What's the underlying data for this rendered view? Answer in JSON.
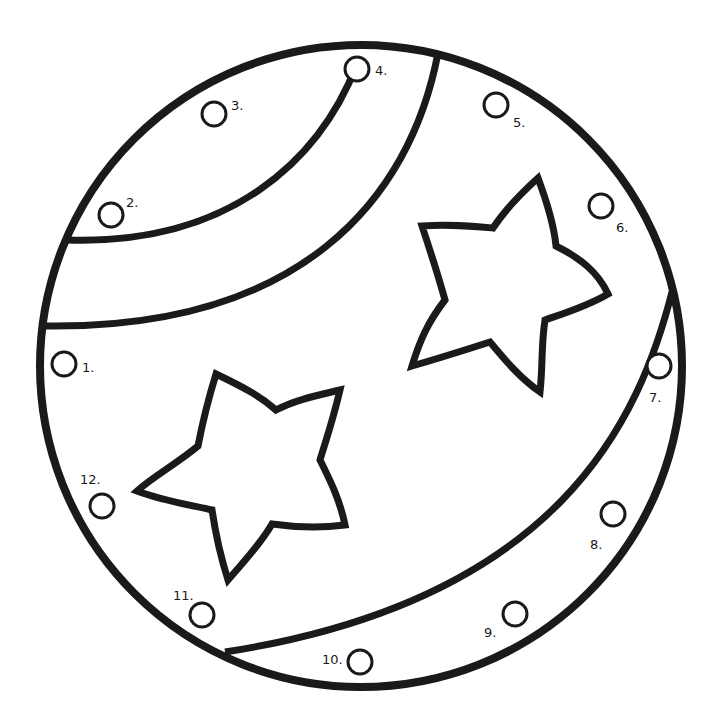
{
  "worksheet": {
    "type": "dot-to-dot coloring page",
    "subject": "ball with stars and stripes",
    "line_color": "#1a1a1a",
    "background": "#ffffff",
    "dots": [
      {
        "n": 1,
        "label": "1.",
        "cx": 64,
        "cy": 364,
        "lx": 82,
        "ly": 372
      },
      {
        "n": 2,
        "label": "2.",
        "cx": 111,
        "cy": 215,
        "lx": 126,
        "ly": 207
      },
      {
        "n": 3,
        "label": "3.",
        "cx": 214,
        "cy": 114,
        "lx": 231,
        "ly": 110
      },
      {
        "n": 4,
        "label": "4.",
        "cx": 357,
        "cy": 69,
        "lx": 375,
        "ly": 75
      },
      {
        "n": 5,
        "label": "5.",
        "cx": 496,
        "cy": 105,
        "lx": 513,
        "ly": 127
      },
      {
        "n": 6,
        "label": "6.",
        "cx": 601,
        "cy": 206,
        "lx": 616,
        "ly": 232
      },
      {
        "n": 7,
        "label": "7.",
        "cx": 659,
        "cy": 366,
        "lx": 649,
        "ly": 402
      },
      {
        "n": 8,
        "label": "8.",
        "cx": 613,
        "cy": 514,
        "lx": 590,
        "ly": 549
      },
      {
        "n": 9,
        "label": "9.",
        "cx": 515,
        "cy": 614,
        "lx": 484,
        "ly": 637
      },
      {
        "n": 10,
        "label": "10.",
        "cx": 360,
        "cy": 662,
        "lx": 322,
        "ly": 664
      },
      {
        "n": 11,
        "label": "11.",
        "cx": 202,
        "cy": 615,
        "lx": 173,
        "ly": 600
      },
      {
        "n": 12,
        "label": "12.",
        "cx": 102,
        "cy": 506,
        "lx": 80,
        "ly": 484
      }
    ]
  }
}
